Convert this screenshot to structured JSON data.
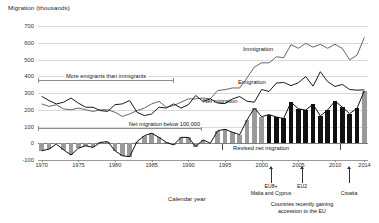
{
  "chart_data": {
    "type": "line",
    "title": "Migration (thousands)",
    "xlabel": "Calendar year",
    "ylabel": "Migration (thousands)",
    "ylim": [
      -100,
      700
    ],
    "yticks": [
      -100,
      0,
      100,
      200,
      300,
      400,
      500,
      600,
      700
    ],
    "xlim": [
      1970,
      2015
    ],
    "xticks": [
      1970,
      1975,
      1980,
      1985,
      1990,
      1995,
      2000,
      2005,
      2010,
      2014
    ],
    "grid": true,
    "legend_position": "inline-labels",
    "x": [
      1970,
      1971,
      1972,
      1973,
      1974,
      1975,
      1976,
      1977,
      1978,
      1979,
      1980,
      1981,
      1982,
      1983,
      1984,
      1985,
      1986,
      1987,
      1988,
      1989,
      1990,
      1991,
      1992,
      1993,
      1994,
      1995,
      1996,
      1997,
      1998,
      1999,
      2000,
      2001,
      2002,
      2003,
      2004,
      2005,
      2006,
      2007,
      2008,
      2009,
      2010,
      2011,
      2012,
      2013,
      2014
    ],
    "series": [
      {
        "name": "Immigration",
        "color": "#555555",
        "values": [
          235,
          220,
          230,
          205,
          200,
          210,
          200,
          190,
          200,
          200,
          185,
          160,
          175,
          195,
          210,
          235,
          250,
          215,
          225,
          245,
          265,
          265,
          270,
          265,
          315,
          320,
          330,
          330,
          390,
          455,
          480,
          480,
          516,
          511,
          589,
          567,
          596,
          574,
          590,
          567,
          591,
          566,
          498,
          526,
          632
        ]
      },
      {
        "name": "Emigration",
        "color": "#1a1a1a",
        "values": [
          280,
          255,
          235,
          245,
          270,
          240,
          215,
          215,
          195,
          190,
          230,
          235,
          255,
          185,
          165,
          175,
          215,
          210,
          235,
          210,
          230,
          285,
          250,
          265,
          240,
          237,
          264,
          279,
          251,
          245,
          321,
          309,
          359,
          363,
          344,
          361,
          398,
          341,
          427,
          368,
          339,
          351,
          321,
          317,
          319
        ]
      },
      {
        "name": "Net migration",
        "color": "#111111",
        "values": [
          -45,
          -35,
          -5,
          -40,
          -70,
          -30,
          -15,
          -25,
          5,
          10,
          -45,
          -75,
          -80,
          10,
          45,
          60,
          35,
          5,
          -10,
          35,
          35,
          -20,
          20,
          0,
          75,
          83,
          66,
          51,
          139,
          210,
          159,
          171,
          157,
          148,
          245,
          206,
          198,
          233,
          163,
          199,
          252,
          215,
          177,
          209,
          313
        ]
      }
    ],
    "bars": {
      "name": "Net migration",
      "color_standard": "#9a9a9a",
      "color_revised": "#111111",
      "values": [
        -45,
        -35,
        -5,
        -40,
        -70,
        -30,
        -15,
        -25,
        5,
        10,
        -45,
        -75,
        -80,
        10,
        45,
        60,
        35,
        5,
        -10,
        35,
        35,
        -20,
        20,
        0,
        75,
        83,
        66,
        51,
        139,
        210,
        159,
        171,
        157,
        148,
        245,
        206,
        198,
        233,
        163,
        199,
        252,
        215,
        177,
        209,
        313
      ]
    },
    "annotations": [
      {
        "id": "more-emigrants",
        "text": "More emigrants than immigrants",
        "x_start": 1970,
        "x_end": 1993
      },
      {
        "id": "net-below-100k",
        "text": "Net migration below 100,000",
        "x_start": 1970,
        "x_end": 1997
      },
      {
        "id": "revised-net-migration",
        "text": "Revised net migration",
        "x_start": 2001,
        "x_end": 2014
      },
      {
        "id": "accession-note",
        "text_line1": "Countries recently gaining",
        "text_line2": "accession to the EU"
      }
    ],
    "accession_markers": [
      {
        "label_line1": "EU8+",
        "label_line2": "Malta and Cyprus",
        "year": 2004
      },
      {
        "label_line1": "EU2",
        "label_line2": "",
        "year": 2007
      },
      {
        "label_line1": "Croatia",
        "label_line2": "",
        "year": 2013
      }
    ]
  },
  "series_labels": {
    "immigration": "Immigration",
    "emigration": "Emigration",
    "net_migration": "Net migration"
  }
}
